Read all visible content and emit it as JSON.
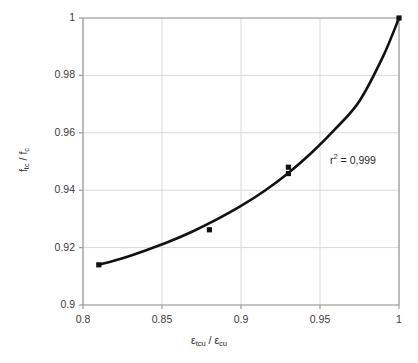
{
  "figure": {
    "background_color": "#ffffff",
    "plot_area": {
      "left": 83,
      "top": 18,
      "right": 399,
      "bottom": 305
    }
  },
  "axis": {
    "y_label_main": "f",
    "y_label_sub1": "tc",
    "y_label_mid": " / f",
    "y_label_sub2": "c",
    "y_label_plain": "ftc / fc",
    "x_label_plain": "εtcu / εcu",
    "x_label_e1": "ε",
    "x_label_s1": "tcu",
    "x_label_mid": " / ",
    "x_label_e2": "ε",
    "x_label_s2": "cu"
  },
  "annotation": {
    "r2_prefix": "r",
    "r2_exp": "2",
    "r2_value": " = 0,999",
    "full_text": "r2 = 0,999"
  },
  "style": {
    "curve_color": "#111111",
    "marker_color": "#111111",
    "grid_color": "#d9d9d9",
    "axis_color": "#9a9a9a",
    "text_color": "#2b2b2b"
  },
  "chart_data": {
    "type": "line",
    "title": "",
    "xlabel": "εtcu / εcu",
    "ylabel": "ftc / fc",
    "xlim": [
      0.8,
      1.0
    ],
    "ylim": [
      0.9,
      1.0
    ],
    "xticks": [
      "0.8",
      "0.85",
      "0.9",
      "0.95",
      "1"
    ],
    "xtick_values": [
      0.8,
      0.85,
      0.9,
      0.95,
      1.0
    ],
    "yticks": [
      "0.9",
      "0.92",
      "0.94",
      "0.96",
      "0.98",
      "1"
    ],
    "ytick_values": [
      0.9,
      0.92,
      0.94,
      0.96,
      0.98,
      1.0
    ],
    "grid": true,
    "legend": false,
    "annotations": [
      "r2 = 0,999"
    ],
    "series": [
      {
        "name": "fitted curve",
        "marker": "none",
        "line": "solid",
        "x": [
          0.81,
          0.825,
          0.84,
          0.855,
          0.87,
          0.885,
          0.9,
          0.915,
          0.93,
          0.945,
          0.96,
          0.975,
          0.99,
          1.0
        ],
        "y": [
          0.914,
          0.9163,
          0.9191,
          0.9222,
          0.9258,
          0.9299,
          0.9345,
          0.9398,
          0.946,
          0.9532,
          0.9615,
          0.9711,
          0.9867,
          1.0
        ]
      },
      {
        "name": "measured points",
        "marker": "square",
        "line": "none",
        "x": [
          0.81,
          0.88,
          0.93,
          0.93,
          1.0
        ],
        "y": [
          0.914,
          0.9262,
          0.948,
          0.9458,
          1.0
        ]
      }
    ]
  }
}
